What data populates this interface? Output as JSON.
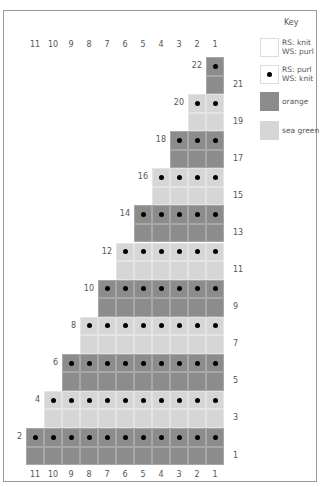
{
  "key": {
    "title": "Key",
    "items": [
      {
        "swatch": "blank",
        "line1": "RS: knit",
        "line2": "WS: purl"
      },
      {
        "swatch": "dot",
        "line1": "RS: purl",
        "line2": "WS: knit"
      },
      {
        "swatch": "orange",
        "line1": "orange",
        "line2": ""
      },
      {
        "swatch": "seagreen",
        "line1": "sea green",
        "line2": ""
      }
    ]
  },
  "colors": {
    "orange": "#8c8c8c",
    "sea_green": "#d6d6d6",
    "purl_dot": "#000000"
  },
  "columns": {
    "top": [
      "11",
      "10",
      "9",
      "8",
      "7",
      "6",
      "5",
      "4",
      "3",
      "2",
      "1"
    ],
    "bottom": [
      "11",
      "10",
      "9",
      "8",
      "7",
      "6",
      "5",
      "4",
      "3",
      "2",
      "1"
    ]
  },
  "rows": [
    {
      "row": 22,
      "stitches": 1,
      "color": "orange",
      "purl": true,
      "label_side": "left"
    },
    {
      "row": 21,
      "stitches": 1,
      "color": "orange",
      "purl": false,
      "label_side": "right"
    },
    {
      "row": 20,
      "stitches": 2,
      "color": "seagreen",
      "purl": true,
      "label_side": "left"
    },
    {
      "row": 19,
      "stitches": 2,
      "color": "seagreen",
      "purl": false,
      "label_side": "right"
    },
    {
      "row": 18,
      "stitches": 3,
      "color": "orange",
      "purl": true,
      "label_side": "left"
    },
    {
      "row": 17,
      "stitches": 3,
      "color": "orange",
      "purl": false,
      "label_side": "right"
    },
    {
      "row": 16,
      "stitches": 4,
      "color": "seagreen",
      "purl": true,
      "label_side": "left"
    },
    {
      "row": 15,
      "stitches": 4,
      "color": "seagreen",
      "purl": false,
      "label_side": "right"
    },
    {
      "row": 14,
      "stitches": 5,
      "color": "orange",
      "purl": true,
      "label_side": "left"
    },
    {
      "row": 13,
      "stitches": 5,
      "color": "orange",
      "purl": false,
      "label_side": "right"
    },
    {
      "row": 12,
      "stitches": 6,
      "color": "seagreen",
      "purl": true,
      "label_side": "left"
    },
    {
      "row": 11,
      "stitches": 6,
      "color": "seagreen",
      "purl": false,
      "label_side": "right"
    },
    {
      "row": 10,
      "stitches": 7,
      "color": "orange",
      "purl": true,
      "label_side": "left"
    },
    {
      "row": 9,
      "stitches": 7,
      "color": "orange",
      "purl": false,
      "label_side": "right"
    },
    {
      "row": 8,
      "stitches": 8,
      "color": "seagreen",
      "purl": true,
      "label_side": "left"
    },
    {
      "row": 7,
      "stitches": 8,
      "color": "seagreen",
      "purl": false,
      "label_side": "right"
    },
    {
      "row": 6,
      "stitches": 9,
      "color": "orange",
      "purl": true,
      "label_side": "left"
    },
    {
      "row": 5,
      "stitches": 9,
      "color": "orange",
      "purl": false,
      "label_side": "right"
    },
    {
      "row": 4,
      "stitches": 10,
      "color": "seagreen",
      "purl": true,
      "label_side": "left"
    },
    {
      "row": 3,
      "stitches": 10,
      "color": "seagreen",
      "purl": false,
      "label_side": "right"
    },
    {
      "row": 2,
      "stitches": 11,
      "color": "orange",
      "purl": true,
      "label_side": "left"
    },
    {
      "row": 1,
      "stitches": 11,
      "color": "orange",
      "purl": false,
      "label_side": "right"
    }
  ]
}
